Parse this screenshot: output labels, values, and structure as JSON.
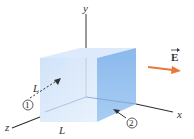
{
  "figure": {
    "axes": {
      "x": "x",
      "y": "y",
      "z": "z"
    },
    "edge_labels": {
      "depth": "L",
      "width": "L"
    },
    "face_markers": {
      "one": "①",
      "two": "②"
    },
    "field": {
      "label": "E",
      "vector_mark": "→",
      "color": "#e8783a"
    },
    "cube_colors": {
      "front": "#cfe3fa",
      "top": "#dbeafc",
      "side": "#8fc0f0"
    }
  }
}
